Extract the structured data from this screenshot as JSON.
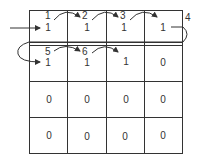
{
  "grid": {
    "rows": 4,
    "cols": 4,
    "values": [
      [
        "1",
        "1",
        "1",
        "1"
      ],
      [
        "1",
        "1",
        "1",
        "0"
      ],
      [
        "0",
        "0",
        "0",
        "0"
      ],
      [
        "0",
        "0",
        "0",
        "0"
      ]
    ]
  },
  "steps": [
    {
      "label": "1"
    },
    {
      "label": "2"
    },
    {
      "label": "3"
    },
    {
      "label": "4"
    },
    {
      "label": "5"
    },
    {
      "label": "6"
    }
  ],
  "colors": {
    "line": "#333333",
    "background": "#ffffff"
  }
}
